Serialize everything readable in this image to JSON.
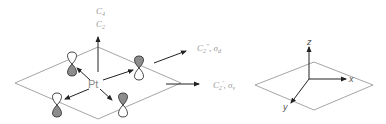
{
  "diagram": {
    "left_panel": {
      "central_atom": "Pt",
      "principal_axis_labels": {
        "top": "C",
        "top_sub": "4",
        "bottom": "C",
        "bottom_sub": "2"
      },
      "diagonal_axis_label": {
        "main": "C",
        "sub": "2",
        "prime": "″",
        "sep": ", ",
        "sigma": "σ",
        "sigma_sub": "d"
      },
      "edge_axis_label": {
        "main": "C",
        "sub": "2",
        "prime": "′",
        "sep": ", ",
        "sigma": "σ",
        "sigma_sub": "v"
      },
      "orbitals": [
        {
          "position": "top-left",
          "top_lobe": "white",
          "bottom_lobe": "gray"
        },
        {
          "position": "top-right",
          "top_lobe": "gray",
          "bottom_lobe": "white"
        },
        {
          "position": "bottom-left",
          "top_lobe": "white",
          "bottom_lobe": "gray"
        },
        {
          "position": "bottom-right",
          "top_lobe": "gray",
          "bottom_lobe": "white"
        }
      ]
    },
    "right_panel": {
      "axes": {
        "z": "z",
        "x": "x",
        "y": "y"
      }
    },
    "colors": {
      "plane_stroke": "#9e9e9e",
      "arrow": "#222222",
      "lobe_shaded": "#8c8c8c",
      "lobe_outline": "#333333",
      "label": "#9a9a9a"
    }
  }
}
